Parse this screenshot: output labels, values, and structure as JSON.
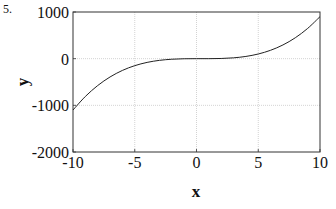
{
  "problem_number": "5.",
  "chart_data": {
    "type": "line",
    "title": "",
    "xlabel": "x",
    "ylabel": "y",
    "xlim": [
      -10,
      10
    ],
    "ylim": [
      -2000,
      1000
    ],
    "grid": true,
    "legend": null,
    "x_ticks": [
      -10,
      -5,
      0,
      5,
      10
    ],
    "x_tick_labels": [
      "-10",
      "-5",
      "0",
      "5",
      "10"
    ],
    "y_ticks": [
      1000,
      0,
      -1000,
      -2000
    ],
    "y_tick_labels": [
      "1000",
      "0",
      "-1000",
      "-2000"
    ],
    "series": [
      {
        "name": "y = x^3 - x^2",
        "x": [
          -10,
          -9,
          -8,
          -7,
          -6,
          -5,
          -4,
          -3,
          -2,
          -1,
          0,
          1,
          2,
          3,
          4,
          5,
          6,
          7,
          8,
          9,
          10
        ],
        "values": [
          -1100,
          -810,
          -576,
          -392,
          -252,
          -150,
          -80,
          -36,
          -12,
          -2,
          0,
          0,
          4,
          18,
          48,
          100,
          180,
          294,
          448,
          648,
          900
        ]
      }
    ]
  }
}
